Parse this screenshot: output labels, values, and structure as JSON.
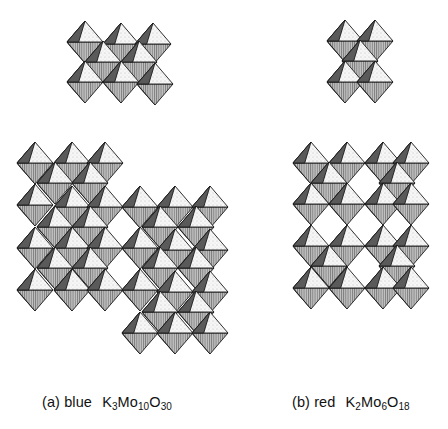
{
  "figure": {
    "style": {
      "top_face_fill": "#f4f4f4",
      "bottom_face_fill": "#a9a9a9",
      "side_face_fill": "#5a5a5a",
      "edge_color": "#1a1a1a"
    },
    "panels": [
      {
        "id": "a",
        "label": "(a)",
        "color_name": "blue",
        "formula": {
          "K": "K",
          "K_sub": "3",
          "Mo": "Mo",
          "Mo_sub": "10",
          "O": "O",
          "O_sub": "30"
        },
        "formula_text": "K3Mo10O30",
        "clusters": [
          {
            "name": "cluster-a-top",
            "octahedra": [
              [
                85,
                42
              ],
              [
                121,
                44
              ],
              [
                153,
                44
              ],
              [
                103,
                62
              ],
              [
                139,
                62
              ],
              [
                85,
                82
              ],
              [
                121,
                82
              ],
              [
                155,
                84
              ]
            ]
          },
          {
            "name": "cluster-a-lower",
            "octahedra": [
              [
                35,
                163
              ],
              [
                72,
                163
              ],
              [
                105,
                163
              ],
              [
                55,
                183
              ],
              [
                90,
                183
              ],
              [
                35,
                205
              ],
              [
                72,
                207
              ],
              [
                105,
                207
              ],
              [
                140,
                207
              ],
              [
                175,
                207
              ],
              [
                210,
                207
              ],
              [
                55,
                227
              ],
              [
                90,
                227
              ],
              [
                160,
                227
              ],
              [
                196,
                227
              ],
              [
                35,
                248
              ],
              [
                72,
                248
              ],
              [
                105,
                248
              ],
              [
                140,
                248
              ],
              [
                175,
                250
              ],
              [
                210,
                250
              ],
              [
                55,
                268
              ],
              [
                90,
                268
              ],
              [
                160,
                268
              ],
              [
                196,
                268
              ],
              [
                35,
                290
              ],
              [
                72,
                290
              ],
              [
                105,
                290
              ],
              [
                140,
                290
              ],
              [
                175,
                292
              ],
              [
                210,
                292
              ],
              [
                160,
                312
              ],
              [
                196,
                312
              ],
              [
                140,
                333
              ],
              [
                175,
                333
              ],
              [
                210,
                333
              ]
            ]
          }
        ]
      },
      {
        "id": "b",
        "label": "(b)",
        "color_name": "red",
        "formula": {
          "K": "K",
          "K_sub": "2",
          "Mo": "Mo",
          "Mo_sub": "6",
          "O": "O",
          "O_sub": "18"
        },
        "formula_text": "K2Mo6O18",
        "clusters": [
          {
            "name": "cluster-b-top",
            "octahedra": [
              [
                345,
                41
              ],
              [
                375,
                41
              ],
              [
                360,
                61
              ],
              [
                345,
                82
              ],
              [
                375,
                82
              ]
            ]
          },
          {
            "name": "cluster-b-lower",
            "octahedra": [
              [
                311,
                163
              ],
              [
                347,
                163
              ],
              [
                383,
                163
              ],
              [
                411,
                163
              ],
              [
                329,
                183
              ],
              [
                397,
                183
              ],
              [
                311,
                204
              ],
              [
                347,
                204
              ],
              [
                383,
                204
              ],
              [
                411,
                204
              ],
              [
                311,
                246
              ],
              [
                347,
                246
              ],
              [
                383,
                246
              ],
              [
                411,
                246
              ],
              [
                329,
                266
              ],
              [
                397,
                266
              ],
              [
                311,
                288
              ],
              [
                347,
                288
              ],
              [
                383,
                288
              ],
              [
                411,
                288
              ]
            ]
          }
        ]
      }
    ]
  }
}
